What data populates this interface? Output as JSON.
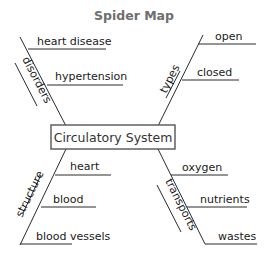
{
  "title": "Spider Map",
  "center": "Circulatory System",
  "branches": [
    {
      "category": "disorders",
      "position": "top-left",
      "details": [
        "heart disease",
        "hypertension"
      ]
    },
    {
      "category": "types",
      "position": "top-right",
      "details": [
        "open",
        "closed"
      ]
    },
    {
      "category": "structure",
      "position": "bottom-left",
      "details": [
        "heart",
        "blood",
        "blood vessels"
      ]
    },
    {
      "category": "transports",
      "position": "bottom-right",
      "details": [
        "oxygen",
        "nutrients",
        "wastes"
      ]
    }
  ],
  "colors": {
    "title": "#6e6e6e",
    "lines": "#2a2a2a",
    "box_border": "#555555",
    "text": "#1a1a1a"
  }
}
